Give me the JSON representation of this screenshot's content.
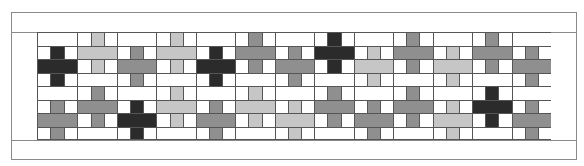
{
  "colors": {
    "dark": "#2b2b2b",
    "mid": "#8f8f8f",
    "light": "#c6c6c6",
    "white": "#ffffff",
    "line": "#555555",
    "border": "#8a8a8a"
  },
  "layout": {
    "block_count": 13,
    "rows_per_block": 8,
    "cols_per_block": 3
  },
  "blocks": [
    {
      "index": 0,
      "offset": "even",
      "top": "dark",
      "bottom": "mid"
    },
    {
      "index": 1,
      "offset": "odd",
      "top": "light",
      "bottom": "mid"
    },
    {
      "index": 2,
      "offset": "even",
      "top": "mid",
      "bottom": "dark"
    },
    {
      "index": 3,
      "offset": "odd",
      "top": "light",
      "bottom": "light"
    },
    {
      "index": 4,
      "offset": "even",
      "top": "dark",
      "bottom": "mid"
    },
    {
      "index": 5,
      "offset": "odd",
      "top": "mid",
      "bottom": "light"
    },
    {
      "index": 6,
      "offset": "even",
      "top": "mid",
      "bottom": "light"
    },
    {
      "index": 7,
      "offset": "odd",
      "top": "dark",
      "bottom": "mid"
    },
    {
      "index": 8,
      "offset": "even",
      "top": "light",
      "bottom": "mid"
    },
    {
      "index": 9,
      "offset": "odd",
      "top": "mid",
      "bottom": "mid"
    },
    {
      "index": 10,
      "offset": "even",
      "top": "light",
      "bottom": "light"
    },
    {
      "index": 11,
      "offset": "odd",
      "top": "mid",
      "bottom": "dark"
    },
    {
      "index": 12,
      "offset": "even",
      "top": "mid",
      "bottom": "mid"
    }
  ]
}
